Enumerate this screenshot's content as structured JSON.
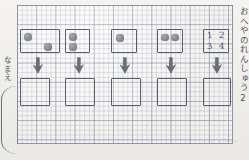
{
  "worksheet": {
    "title_vertical": "おへやのれんしゅう2",
    "name_label": "なまえ",
    "paper_type": "graph-paper",
    "faint_bottom_marks": "•  •  •   •••",
    "stray_pencil_mark": "·"
  },
  "key_box": {
    "numbers": [
      "1",
      "2",
      "3",
      "4"
    ]
  },
  "columns": [
    {
      "index": 1,
      "prompt_dots": [
        {
          "position": "top-left"
        },
        {
          "position": "bottom-right"
        }
      ],
      "dot_count": 2,
      "arrow": "arrow-down-icon",
      "answer": ""
    },
    {
      "index": 2,
      "prompt_dots": [
        {
          "position": "top-left"
        },
        {
          "position": "bottom-left"
        }
      ],
      "dot_count": 2,
      "arrow": "arrow-down-icon",
      "answer": ""
    },
    {
      "index": 3,
      "prompt_dots": [
        {
          "position": "top-left"
        }
      ],
      "dot_count": 1,
      "arrow": "arrow-down-icon",
      "answer": ""
    },
    {
      "index": 4,
      "prompt_dots": [
        {
          "position": "top-left"
        },
        {
          "position": "top-right"
        }
      ],
      "dot_count": 2,
      "arrow": "arrow-down-icon",
      "answer": ""
    },
    {
      "index": 5,
      "prompt_dots": [],
      "dot_count": 0,
      "arrow": "arrow-down-icon",
      "answer": ""
    }
  ],
  "colors": {
    "paper": "#f5f3ef",
    "grid_line": "#7887a5",
    "grid_major": "#5f6e91",
    "pencil": "#5a5f6b",
    "dot": "#86888e"
  }
}
